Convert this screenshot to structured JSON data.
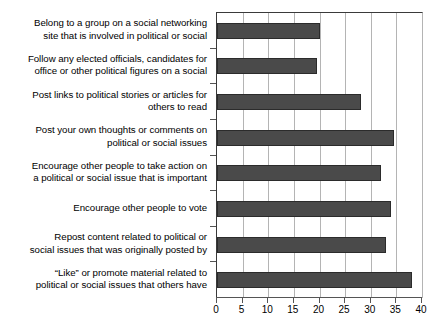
{
  "chart_data": {
    "type": "bar",
    "orientation": "horizontal",
    "title": "",
    "subtitle": "",
    "xlabel": "",
    "ylabel": "",
    "xlim": [
      0,
      40
    ],
    "ylim": null,
    "grid": true,
    "legend": null,
    "legend_position": "none",
    "xticks": [
      0,
      5,
      10,
      15,
      20,
      25,
      30,
      35,
      40
    ],
    "xtick_labels": [
      "0",
      "5",
      "10",
      "15",
      "20",
      "25",
      "30",
      "35",
      "40"
    ],
    "bar_color": "#4a4a4a",
    "bar_edge_color": "#2b2b2b",
    "gridline_color": "#b4b4b4",
    "axis_color": "#555555",
    "categories": [
      "Belong to a group on a social networking\nsite that is involved in political or social",
      "Follow any elected officials, candidates for\noffice or other political figures on a social",
      "Post links to political stories or articles for\nothers to read",
      "Post your own thoughts or comments on\npolitical or social issues",
      "Encourage other people to take action on\na political or social issue that is important",
      "Encourage other people to vote",
      "Repost content related to political or\nsocial issues that was originally posted by",
      "“Like” or promote material related to\npolitical or social issues that others have"
    ],
    "values": [
      20,
      19.5,
      28,
      34.5,
      32,
      34,
      33,
      38
    ]
  }
}
